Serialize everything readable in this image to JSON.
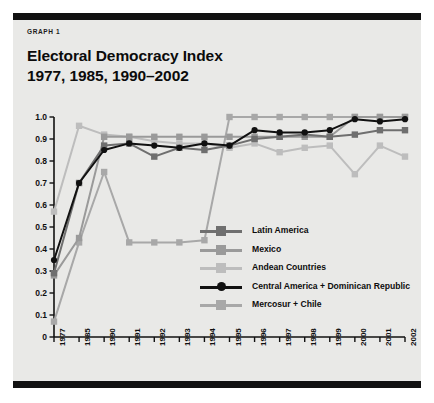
{
  "panel": {
    "kicker": "GRAPH 1",
    "title_line1": "Electoral Democracy Index",
    "title_line2": "1977, 1985, 1990–2002"
  },
  "chart_data": {
    "type": "line",
    "title": "Electoral Democracy Index 1977, 1985, 1990–2002",
    "xlabel": "",
    "ylabel": "",
    "grid": false,
    "legend_position": "inside-center-right",
    "ylim": [
      0.0,
      1.0
    ],
    "ytick_labels": [
      "1.0",
      "0.9",
      "0.8",
      "0.7",
      "0.6",
      "0.5",
      "0.4",
      "0.3",
      "0.2",
      "0.1",
      "0"
    ],
    "ytick_values": [
      1.0,
      0.9,
      0.8,
      0.7,
      0.6,
      0.5,
      0.4,
      0.3,
      0.2,
      0.1,
      0.0
    ],
    "categories": [
      "1977",
      "1985",
      "1990",
      "1991",
      "1992",
      "1993",
      "1994",
      "1995",
      "1996",
      "1997",
      "1998",
      "1999",
      "2000",
      "2001",
      "2002"
    ],
    "series": [
      {
        "name": "Latin America",
        "color": "#6f6f6f",
        "marker": "square",
        "values": [
          0.29,
          0.7,
          0.87,
          0.88,
          0.82,
          0.86,
          0.85,
          0.87,
          0.9,
          0.91,
          0.92,
          0.91,
          0.92,
          0.94,
          0.94
        ]
      },
      {
        "name": "Mexico",
        "color": "#9a9a9a",
        "marker": "square",
        "values": [
          0.28,
          0.45,
          0.91,
          0.91,
          0.91,
          0.91,
          0.91,
          0.91,
          0.91,
          0.91,
          0.91,
          0.91,
          1.0,
          1.0,
          1.0
        ]
      },
      {
        "name": "Andean Countries",
        "color": "#bdbdbd",
        "marker": "square",
        "values": [
          0.57,
          0.96,
          0.92,
          0.91,
          0.89,
          0.88,
          0.88,
          0.86,
          0.88,
          0.84,
          0.86,
          0.87,
          0.74,
          0.87,
          0.82
        ]
      },
      {
        "name": "Central America + Dominican Republic",
        "color": "#111111",
        "marker": "circle",
        "values": [
          0.35,
          0.7,
          0.85,
          0.88,
          0.87,
          0.86,
          0.88,
          0.87,
          0.94,
          0.93,
          0.93,
          0.94,
          0.99,
          0.98,
          0.99
        ]
      },
      {
        "name": "Mercosur + Chile",
        "color": "#a8a8a8",
        "marker": "square",
        "values": [
          0.07,
          0.43,
          0.75,
          0.43,
          0.43,
          0.43,
          0.44,
          1.0,
          1.0,
          1.0,
          1.0,
          1.0,
          1.0,
          1.0,
          1.0
        ]
      }
    ]
  }
}
